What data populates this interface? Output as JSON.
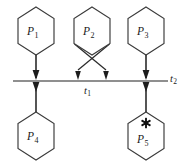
{
  "figure": {
    "kind": "petri-net",
    "background_color": "#ffffff",
    "stroke_color": "#3a3a3a",
    "arc_color": "#2b2b2b",
    "bar_color": "#6a6a6a",
    "token_color": "#111111"
  },
  "places": [
    {
      "id": "p1",
      "symbol": "P",
      "subscript": "1",
      "position": "top-left",
      "tokens": 0,
      "cx": 36,
      "cy": 31,
      "rx": 21,
      "ry": 24
    },
    {
      "id": "p2",
      "symbol": "P",
      "subscript": "2",
      "position": "top-center",
      "tokens": 0,
      "cx": 92,
      "cy": 31,
      "rx": 21,
      "ry": 24
    },
    {
      "id": "p3",
      "symbol": "P",
      "subscript": "3",
      "position": "top-right",
      "tokens": 0,
      "cx": 146,
      "cy": 31,
      "rx": 21,
      "ry": 24
    },
    {
      "id": "p4",
      "symbol": "P",
      "subscript": "4",
      "position": "bottom-left",
      "tokens": 0,
      "cx": 36,
      "cy": 136,
      "rx": 21,
      "ry": 24
    },
    {
      "id": "p5",
      "symbol": "P",
      "subscript": "5",
      "position": "bottom-right",
      "tokens": 1,
      "cx": 146,
      "cy": 136,
      "rx": 21,
      "ry": 24
    }
  ],
  "transitions": [
    {
      "id": "t1",
      "symbol": "t",
      "subscript": "1",
      "label_x": 87,
      "label_y": 88
    },
    {
      "id": "t2",
      "symbol": "t",
      "subscript": "2",
      "label_x": 170,
      "label_y": 76
    }
  ],
  "bar": {
    "x1": 13,
    "x2": 168,
    "y": 81
  },
  "arcs": [
    {
      "id": "arc-p1-t1",
      "from": "p1",
      "to": "bar",
      "direction": "into-bar",
      "x": 36
    },
    {
      "id": "arc-t1-p4",
      "from": "bar",
      "to": "p4",
      "direction": "out-of-bar",
      "x": 36
    },
    {
      "id": "arc-p2-left",
      "from": "p2",
      "to": "bar",
      "direction": "into-bar",
      "crossing": true,
      "x": 78
    },
    {
      "id": "arc-p2-right",
      "from": "p2",
      "to": "bar",
      "direction": "into-bar",
      "crossing": true,
      "x": 106
    },
    {
      "id": "arc-p3-t2",
      "from": "p3",
      "to": "bar",
      "direction": "into-bar",
      "x": 146
    },
    {
      "id": "arc-t2-p5",
      "from": "bar",
      "to": "p5",
      "direction": "out-of-bar",
      "x": 146
    }
  ],
  "tokens": [
    {
      "id": "token-p5",
      "place": "p5",
      "glyph": "star",
      "cx": 146,
      "cy": 123
    }
  ]
}
